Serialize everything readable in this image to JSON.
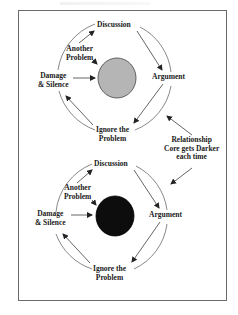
{
  "diagram": {
    "colors": {
      "frame_border": "#6a6a6a",
      "line": "#333333",
      "text": "#1a1a1a",
      "core_light": "#b5b5b5",
      "core_dark": "#0d0d0d"
    },
    "cycles": [
      {
        "core_color_name": "light-gray",
        "labels": {
          "top": "Discussion",
          "right": "Argument",
          "bottom_line1": "Ignore the",
          "bottom_line2": "Problem",
          "left_line1": "Damage",
          "left_line2": "& Silence",
          "inner_line1": "Another",
          "inner_line2": "Problem"
        }
      },
      {
        "core_color_name": "black",
        "labels": {
          "top": "Discussion",
          "right": "Argument",
          "bottom_line1": "Ignore the",
          "bottom_line2": "Problem",
          "left_line1": "Damage",
          "left_line2": "& Silence",
          "inner_line1": "Another",
          "inner_line2": "Problem"
        }
      }
    ],
    "annotation": {
      "line1": "Relationship",
      "line2": "Core gets Darker",
      "line3": "each time"
    }
  }
}
